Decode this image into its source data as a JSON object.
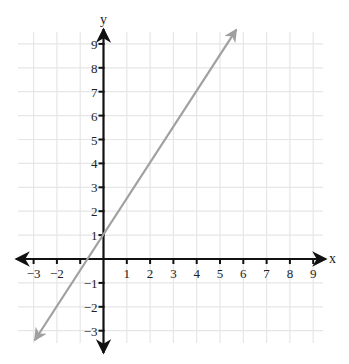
{
  "chart_data": {
    "type": "line",
    "title": "",
    "xlabel": "x",
    "ylabel": "y",
    "xlim": [
      -3,
      9
    ],
    "ylim": [
      -3,
      9
    ],
    "grid": true,
    "x_ticks": [
      -3,
      -2,
      -1,
      1,
      2,
      3,
      4,
      5,
      6,
      7,
      8,
      9
    ],
    "x_tick_labels": [
      "−3",
      "−2",
      "",
      "1",
      "2",
      "3",
      "4",
      "5",
      "6",
      "7",
      "8",
      "9"
    ],
    "y_ticks": [
      -3,
      -2,
      -1,
      1,
      2,
      3,
      4,
      5,
      6,
      7,
      8,
      9
    ],
    "y_tick_labels": [
      "−3",
      "−2",
      "−1",
      "1",
      "2",
      "3",
      "4",
      "5",
      "6",
      "7",
      "8",
      "9"
    ],
    "series": [
      {
        "name": "line",
        "equation": "y = 1.5x + 1",
        "slope": 1.5,
        "intercept": 1,
        "x": [
          -2.95,
          5.7
        ],
        "y": [
          -3.4,
          9.6
        ],
        "arrows_both_ends": true,
        "color": "#a0a0a0"
      }
    ],
    "colors": {
      "axis": "#111111",
      "grid": "#e6e6e6",
      "line": "#a0a0a0"
    }
  }
}
